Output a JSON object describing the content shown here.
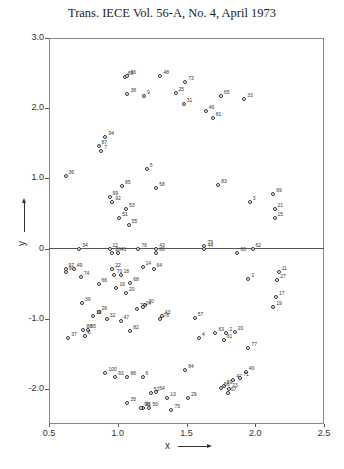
{
  "header": {
    "title": "Trans. IECE Vol. 56-A, No. 4, April 1973"
  },
  "chart_data": {
    "type": "scatter",
    "title": "Trans. IECE Vol. 56-A, No. 4, April 1973",
    "xlabel": "x",
    "ylabel": "y",
    "xlim": [
      0.5,
      2.5
    ],
    "ylim": [
      -2.5,
      3.0
    ],
    "xticks": [
      "0.5",
      "1.0",
      "1.5",
      "2.0",
      "2.5"
    ],
    "yticks": [
      "3.0",
      "2.0",
      "1.0",
      "0",
      "-1.0",
      "-2.0"
    ],
    "grid": false,
    "reference_line": {
      "y": 0
    },
    "marker": "open-circle",
    "points": [
      {
        "label": "89",
        "x": 1.05,
        "y": 2.44
      },
      {
        "label": "96",
        "x": 1.07,
        "y": 2.46
      },
      {
        "label": "48",
        "x": 1.31,
        "y": 2.46
      },
      {
        "label": "73",
        "x": 1.49,
        "y": 2.37
      },
      {
        "label": "38",
        "x": 1.07,
        "y": 2.2
      },
      {
        "label": "9",
        "x": 1.19,
        "y": 2.17
      },
      {
        "label": "25",
        "x": 1.42,
        "y": 2.22
      },
      {
        "label": "31",
        "x": 1.48,
        "y": 2.06
      },
      {
        "label": "65",
        "x": 1.75,
        "y": 2.18
      },
      {
        "label": "33",
        "x": 1.92,
        "y": 2.13
      },
      {
        "label": "46",
        "x": 1.64,
        "y": 1.96
      },
      {
        "label": "81",
        "x": 1.69,
        "y": 1.86
      },
      {
        "label": "94",
        "x": 0.91,
        "y": 1.59
      },
      {
        "label": "87",
        "x": 0.86,
        "y": 1.46
      },
      {
        "label": "7",
        "x": 0.88,
        "y": 1.39
      },
      {
        "label": "36",
        "x": 0.62,
        "y": 1.03
      },
      {
        "label": "5",
        "x": 1.21,
        "y": 1.13
      },
      {
        "label": "85",
        "x": 1.03,
        "y": 0.89
      },
      {
        "label": "58",
        "x": 1.28,
        "y": 0.86
      },
      {
        "label": "83",
        "x": 1.73,
        "y": 0.9
      },
      {
        "label": "99",
        "x": 0.94,
        "y": 0.73
      },
      {
        "label": "92",
        "x": 0.96,
        "y": 0.67
      },
      {
        "label": "53",
        "x": 1.06,
        "y": 0.56
      },
      {
        "label": "51",
        "x": 1.01,
        "y": 0.43
      },
      {
        "label": "55",
        "x": 1.08,
        "y": 0.34
      },
      {
        "label": "3",
        "x": 1.96,
        "y": 0.67
      },
      {
        "label": "69",
        "x": 2.13,
        "y": 0.78
      },
      {
        "label": "21",
        "x": 2.14,
        "y": 0.57
      },
      {
        "label": "15",
        "x": 2.14,
        "y": 0.43
      },
      {
        "label": "34",
        "x": 0.72,
        "y": 0.0
      },
      {
        "label": "12",
        "x": 0.94,
        "y": 0.0
      },
      {
        "label": "76",
        "x": 1.15,
        "y": 0.0
      },
      {
        "label": "43",
        "x": 1.28,
        "y": 0.0
      },
      {
        "label": "79",
        "x": 1.63,
        "y": 0.03
      },
      {
        "label": "44",
        "x": 1.63,
        "y": 0.0
      },
      {
        "label": "62",
        "x": 1.98,
        "y": 0.0
      },
      {
        "label": "60",
        "x": 1.87,
        "y": -0.06
      },
      {
        "label": "28",
        "x": 0.96,
        "y": -0.06
      },
      {
        "label": "41",
        "x": 1.0,
        "y": -0.07
      },
      {
        "label": "14",
        "x": 1.18,
        "y": -0.26
      },
      {
        "label": "80",
        "x": 1.28,
        "y": -0.07
      },
      {
        "label": "64",
        "x": 1.26,
        "y": -0.29
      },
      {
        "label": "97",
        "x": 0.62,
        "y": -0.29
      },
      {
        "label": "90",
        "x": 0.62,
        "y": -0.33
      },
      {
        "label": "49",
        "x": 0.68,
        "y": -0.29
      },
      {
        "label": "74",
        "x": 0.73,
        "y": -0.4
      },
      {
        "label": "22",
        "x": 0.96,
        "y": -0.29
      },
      {
        "label": "70",
        "x": 0.97,
        "y": -0.37
      },
      {
        "label": "18",
        "x": 1.02,
        "y": -0.37
      },
      {
        "label": "68",
        "x": 1.09,
        "y": -0.49
      },
      {
        "label": "66",
        "x": 0.86,
        "y": -0.5
      },
      {
        "label": "16",
        "x": 0.99,
        "y": -0.56
      },
      {
        "label": "20",
        "x": 1.06,
        "y": -0.63
      },
      {
        "label": "30",
        "x": 1.2,
        "y": -0.8
      },
      {
        "label": "72",
        "x": 1.14,
        "y": -0.86
      },
      {
        "label": "24",
        "x": 1.18,
        "y": -0.84
      },
      {
        "label": "39",
        "x": 0.74,
        "y": -0.77
      },
      {
        "label": "26",
        "x": 0.86,
        "y": -0.91
      },
      {
        "label": "10",
        "x": 0.82,
        "y": -0.96
      },
      {
        "label": "32",
        "x": 0.92,
        "y": -1.0
      },
      {
        "label": "47",
        "x": 1.02,
        "y": -1.03
      },
      {
        "label": "43b",
        "x": 1.32,
        "y": -0.96
      },
      {
        "label": "78",
        "x": 1.31,
        "y": -1.01
      },
      {
        "label": "88",
        "x": 0.75,
        "y": -1.16
      },
      {
        "label": "95",
        "x": 0.78,
        "y": -1.16
      },
      {
        "label": "8",
        "x": 0.76,
        "y": -1.24
      },
      {
        "label": "37",
        "x": 0.64,
        "y": -1.28
      },
      {
        "label": "82",
        "x": 1.09,
        "y": -1.17
      },
      {
        "label": "57",
        "x": 1.56,
        "y": -0.99
      },
      {
        "label": "11",
        "x": 2.17,
        "y": -0.34
      },
      {
        "label": "27",
        "x": 2.16,
        "y": -0.45
      },
      {
        "label": "1",
        "x": 1.95,
        "y": -0.44
      },
      {
        "label": "17",
        "x": 2.15,
        "y": -0.69
      },
      {
        "label": "19",
        "x": 2.13,
        "y": -0.84
      },
      {
        "label": "63",
        "x": 1.71,
        "y": -1.2
      },
      {
        "label": "2",
        "x": 1.79,
        "y": -1.21
      },
      {
        "label": "20b",
        "x": 1.85,
        "y": -1.19
      },
      {
        "label": "61",
        "x": 1.77,
        "y": -1.31
      },
      {
        "label": "4",
        "x": 1.59,
        "y": -1.28
      },
      {
        "label": "77",
        "x": 1.95,
        "y": -1.41
      },
      {
        "label": "100",
        "x": 0.91,
        "y": -1.77
      },
      {
        "label": "93",
        "x": 0.98,
        "y": -1.83
      },
      {
        "label": "86",
        "x": 1.07,
        "y": -1.83
      },
      {
        "label": "6",
        "x": 1.18,
        "y": -1.83
      },
      {
        "label": "84",
        "x": 1.49,
        "y": -1.73
      },
      {
        "label": "40",
        "x": 1.93,
        "y": -1.76
      },
      {
        "label": "42",
        "x": 1.84,
        "y": -1.88
      },
      {
        "label": "71",
        "x": 1.89,
        "y": -1.85
      },
      {
        "label": "59",
        "x": 1.77,
        "y": -1.96
      },
      {
        "label": "56",
        "x": 1.75,
        "y": -1.99
      },
      {
        "label": "23",
        "x": 1.81,
        "y": -2.0
      },
      {
        "label": "67",
        "x": 1.8,
        "y": -2.06
      },
      {
        "label": "52",
        "x": 1.24,
        "y": -2.06
      },
      {
        "label": "54",
        "x": 1.28,
        "y": -2.04
      },
      {
        "label": "13",
        "x": 1.36,
        "y": -2.13
      },
      {
        "label": "29",
        "x": 1.51,
        "y": -2.13
      },
      {
        "label": "35",
        "x": 1.07,
        "y": -2.2
      },
      {
        "label": "91",
        "x": 1.18,
        "y": -2.27
      },
      {
        "label": "98",
        "x": 1.17,
        "y": -2.27
      },
      {
        "label": "50",
        "x": 1.23,
        "y": -2.27
      },
      {
        "label": "75",
        "x": 1.39,
        "y": -2.3
      }
    ]
  }
}
